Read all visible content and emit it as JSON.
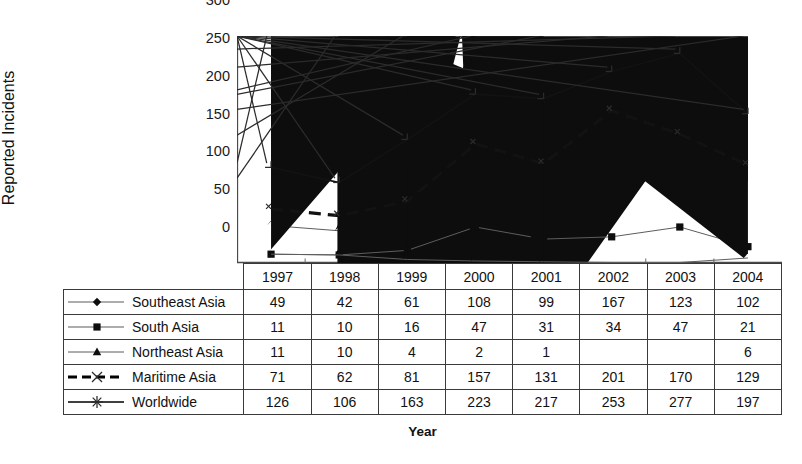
{
  "chart_data": {
    "type": "line",
    "title": "",
    "xlabel": "Year",
    "ylabel": "Reported Incidents",
    "categories": [
      "1997",
      "1998",
      "1999",
      "2000",
      "2001",
      "2002",
      "2003",
      "2004"
    ],
    "ylim": [
      0,
      300
    ],
    "yticks": [
      0,
      50,
      100,
      150,
      200,
      250,
      300
    ],
    "grid": false,
    "legend_position": "table-left",
    "series": [
      {
        "name": "Southeast Asia",
        "marker": "diamond",
        "line_style": "solid",
        "line_weight": "thin",
        "color": "#000000",
        "values": [
          49,
          42,
          61,
          108,
          99,
          167,
          123,
          102
        ]
      },
      {
        "name": "South Asia",
        "marker": "square",
        "line_style": "solid",
        "line_weight": "thin",
        "color": "#000000",
        "values": [
          11,
          10,
          16,
          47,
          31,
          34,
          47,
          21
        ]
      },
      {
        "name": "Northeast Asia",
        "marker": "triangle",
        "line_style": "solid",
        "line_weight": "thin",
        "color": "#000000",
        "values": [
          11,
          10,
          4,
          2,
          1,
          null,
          null,
          6
        ]
      },
      {
        "name": "Maritime Asia",
        "marker": "x",
        "line_style": "dashed",
        "line_weight": "thick",
        "color": "#000000",
        "values": [
          71,
          62,
          81,
          157,
          131,
          201,
          170,
          129
        ]
      },
      {
        "name": "Worldwide",
        "marker": "asterisk",
        "line_style": "solid",
        "line_weight": "medium",
        "color": "#000000",
        "values": [
          126,
          106,
          163,
          223,
          217,
          253,
          277,
          197
        ]
      }
    ]
  },
  "table": {
    "header_blank_label": "",
    "year_headers": [
      "1997",
      "1998",
      "1999",
      "2000",
      "2001",
      "2002",
      "2003",
      "2004"
    ],
    "rows": [
      {
        "label": "Southeast Asia",
        "cells": [
          "49",
          "42",
          "61",
          "108",
          "99",
          "167",
          "123",
          "102"
        ]
      },
      {
        "label": "South Asia",
        "cells": [
          "11",
          "10",
          "16",
          "47",
          "31",
          "34",
          "47",
          "21"
        ]
      },
      {
        "label": "Northeast Asia",
        "cells": [
          "11",
          "10",
          "4",
          "2",
          "1",
          "",
          "",
          "6"
        ]
      },
      {
        "label": "Maritime Asia",
        "cells": [
          "71",
          "62",
          "81",
          "157",
          "131",
          "201",
          "170",
          "129"
        ]
      },
      {
        "label": "Worldwide",
        "cells": [
          "126",
          "106",
          "163",
          "223",
          "217",
          "253",
          "277",
          "197"
        ]
      }
    ]
  },
  "axes": {
    "y_title": "Reported Incidents",
    "x_title": "Year",
    "y_tick_labels": [
      "300",
      "250",
      "200",
      "150",
      "100",
      "50",
      "0"
    ]
  },
  "colors": {
    "ink": "#000000",
    "border": "#3a3a3a",
    "thin_line": "#555555",
    "background": "#ffffff"
  }
}
